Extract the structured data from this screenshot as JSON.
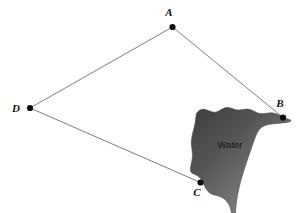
{
  "figure": {
    "background_color": "#ffffff",
    "width": 297,
    "height": 213,
    "vertices": [
      {
        "id": "A",
        "label": "A",
        "x": 172.5,
        "y": 27.0,
        "label_x": 169.0,
        "label_y": 16.0,
        "dot_r": 3.1
      },
      {
        "id": "B",
        "label": "B",
        "x": 283.0,
        "y": 117.5,
        "label_x": 280.0,
        "label_y": 107.0,
        "dot_r": 3.1
      },
      {
        "id": "C",
        "label": "C",
        "x": 200.5,
        "y": 182.5,
        "label_x": 197.0,
        "label_y": 196.0,
        "dot_r": 3.1
      },
      {
        "id": "D",
        "label": "D",
        "x": 30.0,
        "y": 108.0,
        "label_x": 16.0,
        "label_y": 112.0,
        "dot_r": 3.1
      }
    ],
    "edges": [
      {
        "id": "edge-DA",
        "from": "D",
        "to": "A",
        "path": "M 30 108 L 172.5 27"
      },
      {
        "id": "edge-AB",
        "from": "A",
        "to": "B",
        "path": "M 172.5 27 L 283 117.5"
      },
      {
        "id": "edge-DC",
        "from": "D",
        "to": "C",
        "path": "M 30 108 L 200.5 182.5"
      }
    ],
    "edge_color": "#6e6e6e",
    "vertex_color": "#0d0d0d",
    "water": {
      "label": "Water",
      "label_x": 230.0,
      "label_y": 148.0,
      "gradient_from": "#3e3e3e",
      "gradient_to": "#9a9a9a",
      "outline_color": "#4a4a4a",
      "path": "M 196.5 113.5 C 198.5 110.0 202.0 108.6 205.5 109.6 C 209.0 110.6 212.0 112.6 215.5 112.2 C 219.5 111.7 222.0 108.2 226.0 107.6 C 230.0 107.0 233.5 109.6 237.5 110.0 C 241.5 110.4 245.0 108.5 249.0 109.2 C 253.0 109.9 256.0 113.0 260.0 113.6 C 264.5 114.3 269.0 112.2 273.5 113.0 C 278.0 113.8 281.5 116.8 285.5 118.2 C 288.5 119.3 290.5 119.6 291.0 120.6 C 291.4 121.5 289.5 122.0 286.5 122.4 C 281.0 123.2 274.0 123.3 268.5 124.5 C 263.5 125.6 260.5 127.6 258.5 130.6 C 256.0 134.5 254.5 139.5 252.5 145.0 C 250.0 152.0 247.5 159.5 245.0 167.0 C 242.5 174.5 240.5 181.5 239.0 188.0 C 237.5 194.5 236.5 200.5 236.0 206.0 C 235.7 209.5 235.5 211.5 235.5 213.0 L 231.5 213.0 C 231.0 209.5 230.0 206.0 228.0 203.0 C 226.0 200.0 223.0 197.8 220.0 196.6 C 217.0 195.4 214.0 195.2 211.5 194.0 C 209.0 192.8 207.0 190.6 205.5 188.0 C 204.0 185.4 203.0 182.4 201.5 180.0 C 200.0 177.6 198.0 176.0 196.0 175.0 C 194.0 174.0 192.0 173.6 191.0 172.0 C 190.0 170.4 190.4 168.0 191.0 165.0 C 191.6 162.0 192.5 158.5 192.5 155.0 C 192.5 151.5 191.6 148.0 191.4 144.5 C 191.2 141.0 191.7 137.5 192.5 134.0 C 193.3 130.5 194.4 127.0 195.0 123.5 C 195.6 120.0 195.7 116.8 196.5 113.5 Z"
    }
  }
}
